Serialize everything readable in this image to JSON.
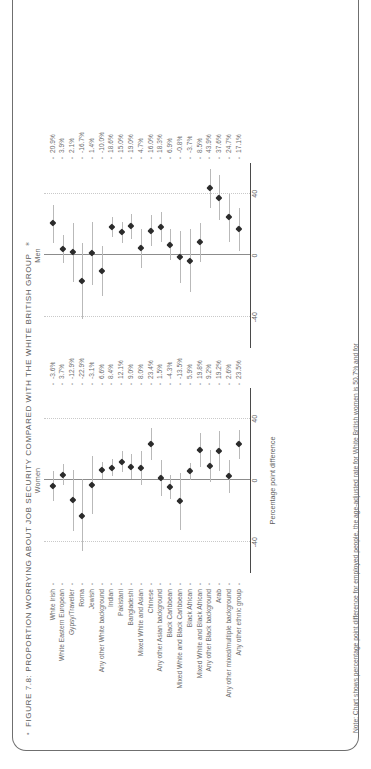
{
  "figure": {
    "title": "FIGURE 7.8: PROPORTION WORRYING ABOUT JOB SECURITY COMPARED WITH THE WHITE BRITISH GROUP",
    "bullet": "•",
    "bullet_end": "✶",
    "note": "Note: Chart shows percentage point difference for employed people, the age-adjusted rate for White British women is 50.7% and for",
    "axis_title": "Percentage point difference"
  },
  "panels": {
    "women_label": "Women",
    "men_label": "Men"
  },
  "chart_data": {
    "type": "scatter",
    "title": "FIGURE 7.8: PROPORTION WORRYING ABOUT JOB SECURITY COMPARED WITH THE WHITE BRITISH GROUP",
    "xlabel": "Percentage point difference",
    "ylabel": "",
    "xlim": [
      -60,
      60
    ],
    "xticks": [
      -40,
      0,
      40
    ],
    "xticklabels": [
      "-40",
      "0",
      "40"
    ],
    "grid": true,
    "legend": "none",
    "reference_line": 0,
    "categories": [
      "White Irish",
      "White Eastern European",
      "Gypsy/Traveller",
      "Roma",
      "Jewish",
      "Any other White background",
      "Indian",
      "Pakistani",
      "Bangladeshi",
      "Mixed White and Asian",
      "Chinese",
      "Any other Asian background",
      "Black Caribbean",
      "Mixed White and Black Caribbean",
      "Black African",
      "Mixed White and Black African",
      "Any other Black background",
      "Arab",
      "Any other mixed/multiple background",
      "Any other ethnic group"
    ],
    "series": [
      {
        "name": "Women",
        "value_labels": [
          "-3.6%",
          "3.7%",
          "-12.9%",
          "-22.9%",
          "-3.1%",
          "6.6%",
          "8.4%",
          "12.1%",
          "9.0%",
          "8.0%",
          "23.4%",
          "1.5%",
          "-4.3%",
          "-13.5%",
          "5.9%",
          "19.8%",
          "9.2%",
          "19.2%",
          "2.6%",
          "23.5%"
        ],
        "values": [
          -3.6,
          3.7,
          -12.9,
          -22.9,
          -3.1,
          6.6,
          8.4,
          12.1,
          9.0,
          8.0,
          23.4,
          1.5,
          -4.3,
          -13.5,
          5.9,
          19.8,
          9.2,
          19.2,
          2.6,
          23.5
        ],
        "ci_low": [
          -13.0,
          -3.0,
          -33.0,
          -46.0,
          -22.0,
          1.0,
          3.0,
          5.5,
          1.0,
          -3.0,
          13.0,
          -10.0,
          -12.0,
          -32.0,
          0.5,
          9.0,
          -1.0,
          6.0,
          -8.0,
          14.0
        ],
        "ci_high": [
          6.0,
          10.5,
          7.0,
          1.0,
          16.0,
          12.0,
          14.0,
          19.0,
          17.0,
          19.0,
          34.0,
          13.0,
          3.5,
          5.0,
          11.5,
          31.0,
          19.5,
          32.0,
          13.0,
          33.0
        ]
      },
      {
        "name": "Men",
        "value_labels": [
          "20.9%",
          "3.9%",
          "2.1%",
          "-16.7%",
          "1.4%",
          "-10.0%",
          "18.6%",
          "15.0%",
          "19.0%",
          "4.7%",
          "16.0%",
          "18.3%",
          "6.9%",
          "-0.8%",
          "-3.7%",
          "8.5%",
          "43.9%",
          "37.6%",
          "24.7%",
          "17.1%"
        ],
        "values": [
          20.9,
          3.9,
          2.1,
          -16.7,
          1.4,
          -10.0,
          18.6,
          15.0,
          19.0,
          4.7,
          16.0,
          18.3,
          6.9,
          -0.8,
          -3.7,
          8.5,
          43.9,
          37.6,
          24.7,
          17.1
        ],
        "ci_low": [
          8.0,
          -5.0,
          -17.0,
          -41.0,
          -19.0,
          -26.0,
          12.0,
          8.0,
          11.0,
          -8.0,
          6.0,
          9.0,
          -3.0,
          -18.0,
          -24.0,
          -4.0,
          31.0,
          23.0,
          9.0,
          3.0
        ],
        "ci_high": [
          33.0,
          13.0,
          21.0,
          8.0,
          22.0,
          6.0,
          25.0,
          22.0,
          27.0,
          17.0,
          26.0,
          28.0,
          17.0,
          16.0,
          17.0,
          21.0,
          56.0,
          52.0,
          40.0,
          31.0
        ]
      }
    ]
  }
}
